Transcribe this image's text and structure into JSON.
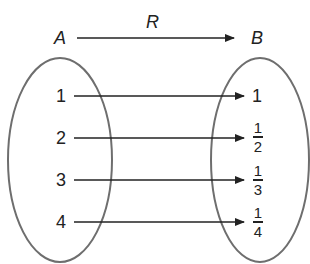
{
  "diagram": {
    "relation_label": "R",
    "domain_label": "A",
    "codomain_label": "B",
    "domain": [
      "1",
      "2",
      "3",
      "4"
    ],
    "codomain": [
      {
        "type": "whole",
        "value": "1"
      },
      {
        "type": "fraction",
        "num": "1",
        "den": "2"
      },
      {
        "type": "fraction",
        "num": "1",
        "den": "3"
      },
      {
        "type": "fraction",
        "num": "1",
        "den": "4"
      }
    ],
    "mappings": [
      [
        "1",
        "1"
      ],
      [
        "2",
        "1/2"
      ],
      [
        "3",
        "1/3"
      ],
      [
        "4",
        "1/4"
      ]
    ],
    "colors": {
      "ellipse": "#6e6e6e",
      "arrow": "#222222",
      "text": "#222222"
    }
  }
}
